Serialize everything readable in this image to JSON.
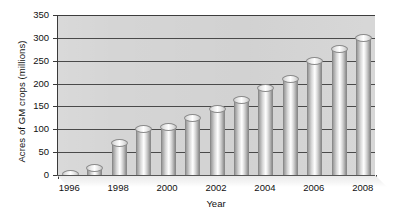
{
  "chart_data": {
    "type": "bar",
    "title": "",
    "subtitle": "",
    "xlabel": "Year",
    "ylabel": "Acres of GM crops (millions)",
    "categories": [
      "1996",
      "1997",
      "1998",
      "1999",
      "2000",
      "2001",
      "2002",
      "2003",
      "2004",
      "2005",
      "2006",
      "2007",
      "2008"
    ],
    "values": [
      2,
      15,
      70,
      100,
      105,
      125,
      145,
      165,
      190,
      210,
      250,
      275,
      300
    ],
    "ylim": [
      0,
      350
    ],
    "ytick_values": [
      0,
      50,
      100,
      150,
      200,
      250,
      300,
      350
    ],
    "ytick_labels": [
      "0",
      "50",
      "100",
      "150",
      "200",
      "250",
      "300",
      "350"
    ],
    "xtick_labels": [
      "1996",
      "1998",
      "2000",
      "2002",
      "2004",
      "2006",
      "2008"
    ],
    "xtick_categories": [
      "1996",
      "1998",
      "2000",
      "2002",
      "2004",
      "2006",
      "2008"
    ],
    "grid": true,
    "grid_axis": "y",
    "legend": false,
    "legend_position": "none",
    "bar_style": "3d-cylinder",
    "plot_background": "#d5d5d5",
    "bar_color": "#d9d9d9",
    "axis_color": "#3a3a3a",
    "gridline_color": "#4a4a4a",
    "page_background": "#ffffff"
  }
}
